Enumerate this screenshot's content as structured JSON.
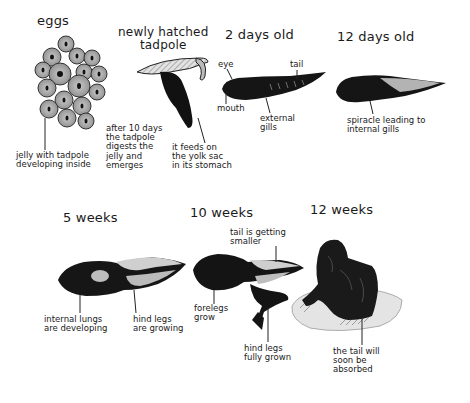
{
  "diagram": {
    "type": "life-cycle",
    "stages": [
      {
        "id": "eggs",
        "title": "eggs",
        "annotations": [
          "jelly with tadpole\ndeveloping inside"
        ]
      },
      {
        "id": "newly-hatched",
        "title": "newly hatched\ntadpole",
        "annotations": [
          "after 10 days\nthe tadpole\ndigests the\njelly and\nemerges",
          "it feeds on\nthe yolk sac\nin its stomach"
        ]
      },
      {
        "id": "2-days",
        "title": "2 days old",
        "annotations": [
          "eye",
          "tail",
          "mouth",
          "external\ngills"
        ]
      },
      {
        "id": "12-days",
        "title": "12 days old",
        "annotations": [
          "spiracle leading to\ninternal gills"
        ]
      },
      {
        "id": "5-weeks",
        "title": "5 weeks",
        "annotations": [
          "internal lungs\nare developing",
          "hind legs\nare growing"
        ]
      },
      {
        "id": "10-weeks",
        "title": "10 weeks",
        "annotations": [
          "tail is getting\nsmaller",
          "forelegs\ngrow",
          "hind legs\nfully grown"
        ]
      },
      {
        "id": "12-weeks",
        "title": "12 weeks",
        "annotations": [
          "the tail will\nsoon be\nabsorbed"
        ]
      }
    ]
  },
  "colors": {
    "ink": "#111111",
    "egg_fill": "#9a9a9a",
    "stripe": "#cfcfcf",
    "background": "#ffffff"
  }
}
